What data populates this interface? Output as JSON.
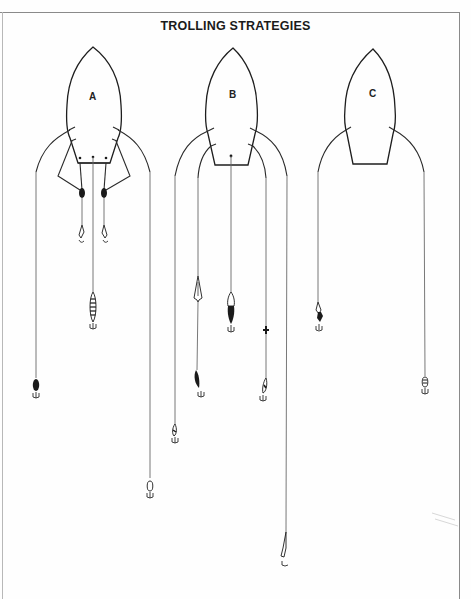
{
  "title": "TROLLING STRATEGIES",
  "boats": [
    {
      "label": "A",
      "description": "Boat with two outrigger-style side lines, two rod-holder lines with inline sinkers and spoons close behind, and one center line with a long lure",
      "lines": [
        {
          "position": "far-left",
          "lure": "dark-plug"
        },
        {
          "position": "inner-left",
          "lure": "spoon",
          "sinker": "inline-weight"
        },
        {
          "position": "center",
          "lure": "banded-plug"
        },
        {
          "position": "inner-right",
          "lure": "spoon",
          "sinker": "inline-weight"
        },
        {
          "position": "far-right",
          "lure": "small-plug"
        }
      ]
    },
    {
      "label": "B",
      "description": "Boat with five lines at staggered depths/distances, including a diving planer and a swivel",
      "lines": [
        {
          "position": "far-left",
          "lure": "small-plug"
        },
        {
          "position": "inner-left",
          "lure": "dark-minnow",
          "attachment": "diving-planer"
        },
        {
          "position": "center",
          "lure": "dark-spoon-plug"
        },
        {
          "position": "inner-right",
          "lure": "small-plug",
          "attachment": "swivel"
        },
        {
          "position": "far-right",
          "lure": "long-slender-plug"
        }
      ]
    },
    {
      "label": "C",
      "description": "Boat with two side lines, one short and one long",
      "lines": [
        {
          "position": "left",
          "lure": "jig"
        },
        {
          "position": "right",
          "lure": "small-plug"
        }
      ]
    }
  ]
}
